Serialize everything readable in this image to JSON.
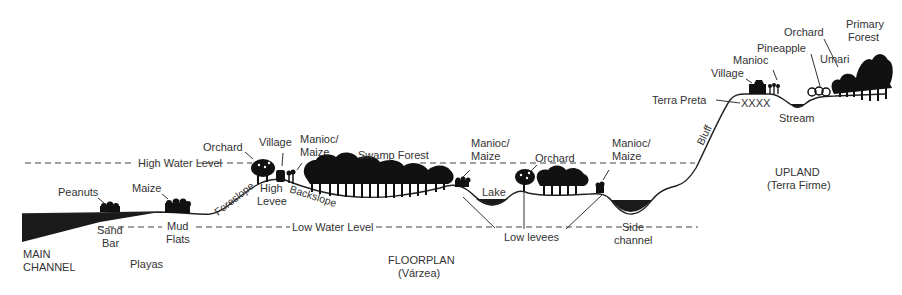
{
  "diagram": {
    "water_levels": {
      "high": "High Water Level",
      "low": "Low Water Level"
    },
    "zones": {
      "main_channel_1": "MAIN",
      "main_channel_2": "CHANNEL",
      "playas": "Playas",
      "floorplan": "FLOORPLAN",
      "floorplan_sub": "(Várzea)",
      "upland": "UPLAND",
      "upland_sub": "(Terra Firme)"
    },
    "landforms": {
      "sand_bar_1": "Sand",
      "sand_bar_2": "Bar",
      "mud_flats_1": "Mud",
      "mud_flats_2": "Flats",
      "foreslope": "Foreslope",
      "high_levee_1": "High",
      "high_levee_2": "Levee",
      "backslope": "Backslope",
      "lake": "Lake",
      "low_levees": "Low levees",
      "side_channel_1": "Side",
      "side_channel_2": "channel",
      "bluff": "Bluff",
      "terra_preta": "Terra Preta",
      "terra_preta_marks": "XXXX",
      "stream": "Stream"
    },
    "land_uses": {
      "peanuts": "Peanuts",
      "maize": "Maize",
      "orchard_levee": "Orchard",
      "village_levee": "Village",
      "manioc_maize_1a": "Manioc/",
      "manioc_maize_1b": "Maize",
      "swamp_forest": "Swamp Forest",
      "manioc_maize_2a": "Manioc/",
      "manioc_maize_2b": "Maize",
      "orchard_low": "Orchard",
      "manioc_maize_3a": "Manioc/",
      "manioc_maize_3b": "Maize",
      "village_upland": "Village",
      "manioc_upland": "Manioc",
      "pineapple": "Pineapple",
      "orchard_upland": "Orchard",
      "umari": "Umari",
      "primary_forest_1": "Primary",
      "primary_forest_2": "Forest"
    }
  }
}
